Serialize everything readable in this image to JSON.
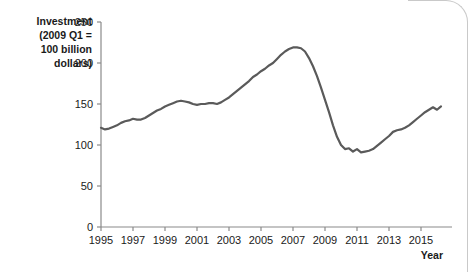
{
  "chart_data": {
    "type": "line",
    "title": "",
    "ylabel": "Investment (2009 Q1 = 100 billion dollars)",
    "ylabel_lines": [
      "Investment",
      "(2009 Q1 =",
      "100 billion",
      "dollars)"
    ],
    "xlabel": "Year",
    "xlim": [
      1995,
      2016.5
    ],
    "ylim": [
      0,
      250
    ],
    "yticks": [
      0,
      50,
      100,
      150,
      200,
      250
    ],
    "ytick_labels": [
      "0",
      "50",
      "100",
      "150",
      "200",
      "250"
    ],
    "xticks": [
      1995,
      1997,
      1999,
      2001,
      2003,
      2005,
      2007,
      2009,
      2011,
      2013,
      2015
    ],
    "xtick_labels": [
      "1995",
      "1997",
      "1999",
      "2001",
      "2003",
      "2005",
      "2007",
      "2009",
      "2011",
      "2013",
      "2015"
    ],
    "grid": false,
    "legend": false,
    "legend_position": "none",
    "line_color": "#5a5a5a",
    "line_width": 2.2,
    "series": [
      {
        "name": "Investment",
        "x": [
          1995.0,
          1995.25,
          1995.5,
          1995.75,
          1996.0,
          1996.25,
          1996.5,
          1996.75,
          1997.0,
          1997.25,
          1997.5,
          1997.75,
          1998.0,
          1998.25,
          1998.5,
          1998.75,
          1999.0,
          1999.25,
          1999.5,
          1999.75,
          2000.0,
          2000.25,
          2000.5,
          2000.75,
          2001.0,
          2001.25,
          2001.5,
          2001.75,
          2002.0,
          2002.25,
          2002.5,
          2002.75,
          2003.0,
          2003.25,
          2003.5,
          2003.75,
          2004.0,
          2004.25,
          2004.5,
          2004.75,
          2005.0,
          2005.25,
          2005.5,
          2005.75,
          2006.0,
          2006.25,
          2006.5,
          2006.75,
          2007.0,
          2007.25,
          2007.5,
          2007.75,
          2008.0,
          2008.25,
          2008.5,
          2008.75,
          2009.0,
          2009.25,
          2009.5,
          2009.75,
          2010.0,
          2010.25,
          2010.5,
          2010.75,
          2011.0,
          2011.25,
          2011.5,
          2011.75,
          2012.0,
          2012.25,
          2012.5,
          2012.75,
          2013.0,
          2013.25,
          2013.5,
          2013.75,
          2014.0,
          2014.25,
          2014.5,
          2014.75,
          2015.0,
          2015.25,
          2015.5,
          2015.75,
          2016.0,
          2016.25
        ],
        "values": [
          121,
          119,
          120,
          122,
          124,
          127,
          129,
          130,
          132,
          131,
          131,
          133,
          136,
          139,
          142,
          144,
          147,
          149,
          151,
          153,
          154,
          153,
          152,
          150,
          149,
          150,
          150,
          151,
          151,
          150,
          152,
          155,
          158,
          162,
          166,
          170,
          174,
          178,
          183,
          186,
          190,
          193,
          197,
          200,
          205,
          210,
          214,
          217,
          219,
          219,
          218,
          214,
          206,
          196,
          184,
          170,
          155,
          140,
          124,
          110,
          100,
          95,
          96,
          92,
          95,
          91,
          92,
          93,
          95,
          99,
          103,
          107,
          111,
          116,
          118,
          119,
          121,
          124,
          128,
          132,
          136,
          140,
          143,
          146,
          143,
          147
        ]
      }
    ]
  },
  "axis": {
    "x_title": "Year"
  }
}
